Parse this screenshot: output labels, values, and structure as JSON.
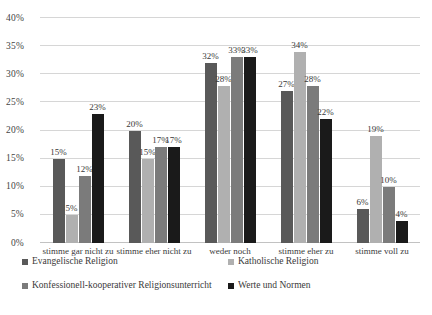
{
  "chart_data": {
    "type": "bar",
    "title": "",
    "subtitle": "",
    "xlabel": "",
    "ylabel": "",
    "ylim": [
      0,
      40
    ],
    "grid": true,
    "legend_position": "bottom",
    "categories": [
      "stimme gar nicht zu",
      "stimme eher nicht zu",
      "weder noch",
      "stimme eher zu",
      "stimme voll zu"
    ],
    "yticks": [
      "0%",
      "5%",
      "10%",
      "15%",
      "20%",
      "25%",
      "30%",
      "35%",
      "40%"
    ],
    "ytick_values": [
      0,
      5,
      10,
      15,
      20,
      25,
      30,
      35,
      40
    ],
    "series": [
      {
        "name": "Evangelische Religion",
        "color": "#595959",
        "values": [
          15,
          20,
          32,
          27,
          6
        ],
        "labels": [
          "15%",
          "20%",
          "32%",
          "27%",
          "6%"
        ]
      },
      {
        "name": "Katholische Religion",
        "color": "#b0b0b0",
        "values": [
          5,
          15,
          28,
          34,
          19
        ],
        "labels": [
          "5%",
          "15%",
          "28%",
          "34%",
          "19%"
        ]
      },
      {
        "name": "Konfessionell-kooperativer Religionsunterricht",
        "color": "#7b7b7b",
        "values": [
          12,
          17,
          33,
          28,
          10
        ],
        "labels": [
          "12%",
          "17%",
          "33%",
          "28%",
          "10%"
        ]
      },
      {
        "name": "Werte und Normen",
        "color": "#1a1a1a",
        "values": [
          23,
          17,
          33,
          22,
          4
        ],
        "labels": [
          "23%",
          "17%",
          "33%",
          "22%",
          "4%"
        ]
      }
    ]
  },
  "axis": {
    "y_labels": [
      "40%",
      "35%",
      "30%",
      "25%",
      "20%",
      "15%",
      "10%",
      "5%",
      "0%"
    ]
  },
  "legend": {
    "items": [
      {
        "label": "Evangelische Religion"
      },
      {
        "label": "Katholische Religion"
      },
      {
        "label": "Konfessionell-kooperativer Religionsunterricht"
      },
      {
        "label": "Werte und Normen"
      }
    ]
  }
}
